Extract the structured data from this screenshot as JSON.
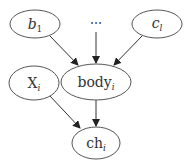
{
  "diagram": {
    "type": "directed-graph",
    "nodes": [
      {
        "id": "b1",
        "base": "b",
        "sub": "1",
        "italic_base": true,
        "cx": 35,
        "cy": 24,
        "rx": 25,
        "ry": 14
      },
      {
        "id": "ellipsis",
        "base": "⋯",
        "sub": "",
        "cx": 96,
        "cy": 24
      },
      {
        "id": "cl",
        "base": "c",
        "sub": "l",
        "italic_base": true,
        "cx": 157,
        "cy": 24,
        "rx": 25,
        "ry": 14
      },
      {
        "id": "Xi",
        "base": "X",
        "sub": "i",
        "italic_base": false,
        "cx": 34,
        "cy": 83,
        "rx": 25,
        "ry": 17
      },
      {
        "id": "bodyi",
        "base": "body",
        "sub": "i",
        "italic_base": false,
        "cx": 96,
        "cy": 82,
        "rx": 35,
        "ry": 18
      },
      {
        "id": "chi",
        "base": "ch",
        "sub": "i",
        "italic_base": false,
        "cx": 96,
        "cy": 143,
        "rx": 24,
        "ry": 16
      }
    ],
    "edges": [
      {
        "from": "b1",
        "to": "bodyi"
      },
      {
        "from": "ellipsis",
        "to": "bodyi"
      },
      {
        "from": "cl",
        "to": "bodyi"
      },
      {
        "from": "Xi",
        "to": "chi"
      },
      {
        "from": "bodyi",
        "to": "chi"
      }
    ],
    "labels": {
      "b1_base": "b",
      "b1_sub": "1",
      "ellipsis": "⋯",
      "cl_base": "c",
      "cl_sub": "l",
      "Xi_base": "X",
      "Xi_sub": "i",
      "bodyi_base": "body",
      "bodyi_sub": "i",
      "chi_base": "ch",
      "chi_sub": "i"
    }
  }
}
